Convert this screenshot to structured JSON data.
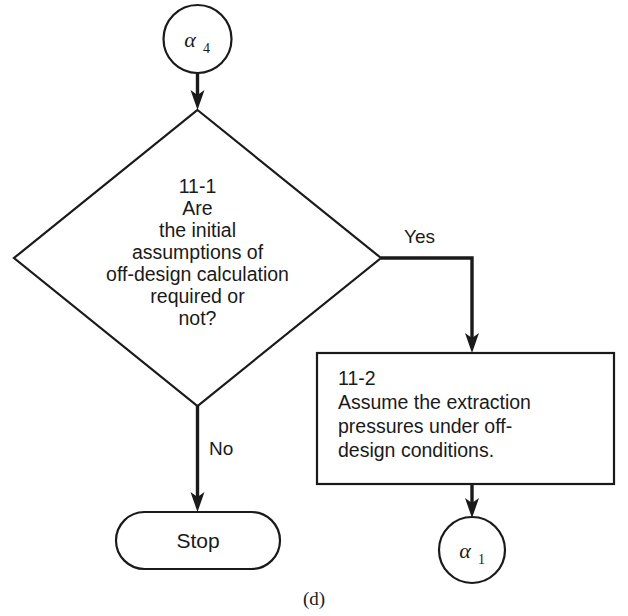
{
  "figure": {
    "caption": "(d)",
    "background_color": "#ffffff",
    "line_color": "#1a1a1a"
  },
  "nodes": {
    "connector_in": {
      "type": "connector-circle",
      "symbol": "α",
      "subscript": "4"
    },
    "decision": {
      "type": "decision-diamond",
      "step": "11-1",
      "lines": [
        "11-1",
        "Are",
        "the initial",
        "assumptions of",
        "off-design calculation",
        "required or",
        "not?"
      ]
    },
    "process": {
      "type": "process-box",
      "step": "11-2",
      "lines": [
        "11-2",
        "Assume the extraction",
        "pressures under off-",
        "design conditions."
      ]
    },
    "terminator_stop": {
      "type": "terminator",
      "label": "Stop"
    },
    "connector_out": {
      "type": "connector-circle",
      "symbol": "α",
      "subscript": "1"
    }
  },
  "edges": {
    "alpha4_to_decision": {
      "label": ""
    },
    "decision_yes": {
      "label": "Yes"
    },
    "decision_no": {
      "label": "No"
    },
    "process_to_alpha1": {
      "label": ""
    }
  }
}
